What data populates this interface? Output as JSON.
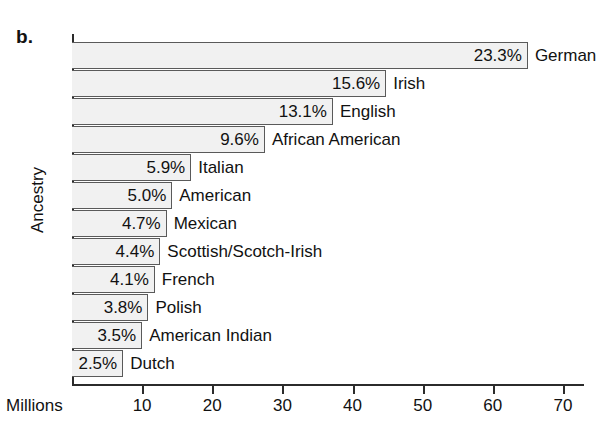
{
  "panel_label": "b.",
  "chart_data": {
    "type": "bar",
    "orientation": "horizontal",
    "title": "",
    "subtitle": "",
    "xlabel": "Millions",
    "ylabel": "Ancestry",
    "grid": false,
    "legend": "none",
    "xlim": [
      0,
      73
    ],
    "xticks": [
      10,
      20,
      30,
      40,
      50,
      60,
      70
    ],
    "xtick_labels": [
      "10",
      "20",
      "30",
      "40",
      "50",
      "60",
      "70"
    ],
    "categories": [
      "German",
      "Irish",
      "English",
      "African American",
      "Italian",
      "American",
      "Mexican",
      "Scottish/Scotch-Irish",
      "French",
      "Polish",
      "American Indian",
      "Dutch"
    ],
    "data_labels": [
      "23.3%",
      "15.6%",
      "13.1%",
      "9.6%",
      "5.9%",
      "5.0%",
      "4.7%",
      "4.4%",
      "4.1%",
      "3.8%",
      "3.5%",
      "2.5%"
    ],
    "percent_values": [
      23.3,
      15.6,
      13.1,
      9.6,
      5.9,
      5.0,
      4.7,
      4.4,
      4.1,
      3.8,
      3.5,
      2.5
    ],
    "values": [
      65.0,
      44.8,
      37.2,
      27.5,
      17.0,
      14.3,
      13.5,
      12.6,
      11.8,
      10.9,
      10.0,
      7.3
    ],
    "bar_fill_color": "#f1f1f1",
    "bar_border_color": "#5a5a5a",
    "axis_color": "#2b2b2b"
  }
}
